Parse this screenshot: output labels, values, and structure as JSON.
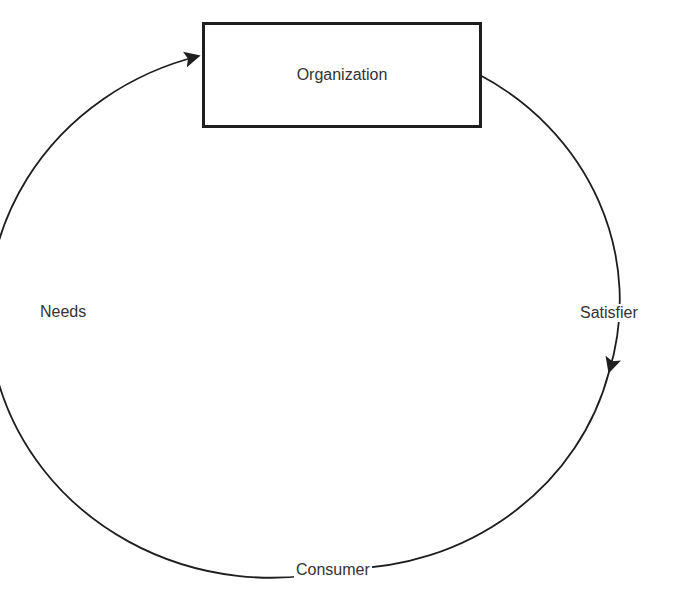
{
  "diagram": {
    "nodes": {
      "organization": "Organization",
      "consumer": "Consumer"
    },
    "edges": {
      "left_arc": "Needs",
      "right_arc": "Satisfier"
    },
    "flow": [
      {
        "from": "Organization",
        "to": "Consumer",
        "label": "Satisfier",
        "direction": "clockwise-down-right"
      },
      {
        "from": "Consumer",
        "to": "Organization",
        "label": "Needs",
        "direction": "up-left-into-box"
      }
    ],
    "colors": {
      "line": "#1e1e1e",
      "text": "#333333",
      "background": "#ffffff"
    }
  }
}
